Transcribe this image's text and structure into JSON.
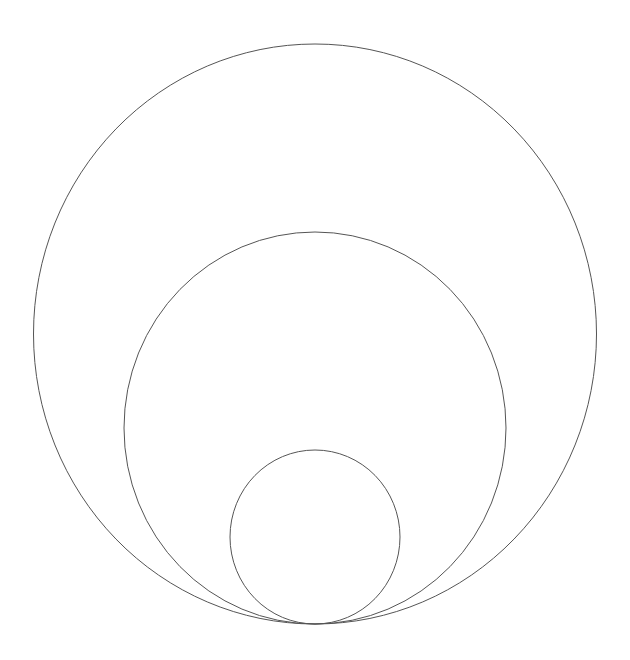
{
  "diagram": {
    "background": "#ffffff",
    "stroke_color": "#555555",
    "tangent_point": {
      "x": 315,
      "y": 624
    },
    "circles": [
      {
        "name": "outer-circle",
        "cx": 315,
        "cy": 334,
        "rx": 281.5,
        "ry": 290
      },
      {
        "name": "middle-circle",
        "cx": 315,
        "cy": 428,
        "rx": 191,
        "ry": 196
      },
      {
        "name": "inner-circle",
        "cx": 315,
        "cy": 537,
        "rx": 85,
        "ry": 87
      }
    ]
  }
}
